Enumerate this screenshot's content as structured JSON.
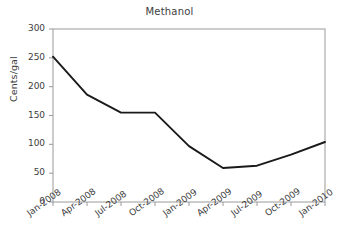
{
  "chart_data": {
    "type": "line",
    "title": "Methanol",
    "xlabel": "",
    "ylabel": "Cents/gal",
    "categories": [
      "Jan-2008",
      "Apr-2008",
      "Jul-2008",
      "Oct-2008",
      "Jan-2009",
      "Apr-2009",
      "Jul-2009",
      "Oct-2009",
      "Jan-2010"
    ],
    "values": [
      252,
      186,
      155,
      155,
      97,
      59,
      63,
      82,
      104
    ],
    "ylim": [
      0,
      300
    ],
    "ytick_labels": [
      "300",
      "250",
      "200",
      "150",
      "100",
      "50",
      "0"
    ],
    "yticks": [
      300,
      250,
      200,
      150,
      100,
      50,
      0
    ],
    "grid": false,
    "legend": "none",
    "series_color": "#1a1a1a",
    "axis_color": "#9a9a9a",
    "background": "#ffffff"
  }
}
